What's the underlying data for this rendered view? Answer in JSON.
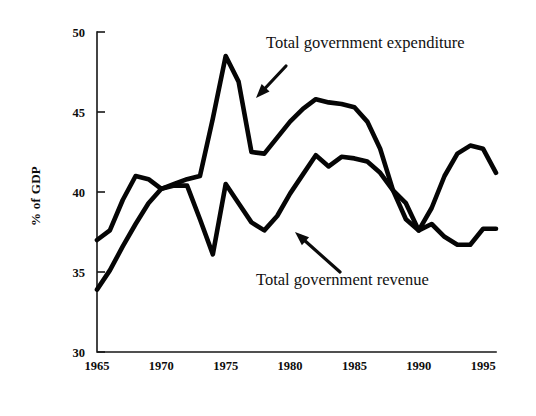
{
  "chart_data": {
    "type": "line",
    "title": "",
    "xlabel": "",
    "ylabel": "% of GDP",
    "xlim": [
      1965,
      1996
    ],
    "ylim": [
      30,
      50
    ],
    "grid": false,
    "legend_position": "inline-annotations",
    "x_ticks": [
      "1965",
      "1970",
      "1975",
      "1980",
      "1985",
      "1990",
      "1995"
    ],
    "x_tick_values": [
      1965,
      1970,
      1975,
      1980,
      1985,
      1990,
      1995
    ],
    "y_ticks": [
      "30",
      "35",
      "40",
      "45",
      "50"
    ],
    "y_tick_values": [
      30,
      35,
      40,
      45,
      50
    ],
    "x": [
      1965,
      1966,
      1967,
      1968,
      1969,
      1970,
      1971,
      1972,
      1973,
      1974,
      1975,
      1976,
      1977,
      1978,
      1979,
      1980,
      1981,
      1982,
      1983,
      1984,
      1985,
      1986,
      1987,
      1988,
      1989,
      1990,
      1991,
      1992,
      1993,
      1994,
      1995,
      1996
    ],
    "series": [
      {
        "name": "Total government expenditure",
        "values": [
          37.0,
          37.6,
          39.5,
          41.0,
          40.8,
          40.2,
          40.5,
          40.8,
          41.0,
          44.6,
          48.5,
          46.9,
          42.5,
          42.4,
          43.4,
          44.4,
          45.2,
          45.8,
          45.6,
          45.5,
          45.3,
          44.4,
          42.7,
          40.1,
          38.3,
          37.6,
          39.0,
          41.0,
          42.4,
          42.9,
          42.7,
          41.2
        ]
      },
      {
        "name": "Total government revenue",
        "values": [
          33.9,
          35.1,
          36.6,
          38.0,
          39.3,
          40.2,
          40.4,
          40.4,
          38.3,
          36.1,
          40.5,
          39.3,
          38.1,
          37.6,
          38.5,
          39.9,
          41.1,
          42.3,
          41.6,
          42.2,
          42.1,
          41.9,
          41.2,
          40.1,
          39.3,
          37.6,
          38.0,
          37.2,
          36.7,
          36.7,
          37.7,
          37.7
        ]
      }
    ],
    "annotations": [
      {
        "text": "Total government expenditure",
        "label_x": 266,
        "label_y": 48,
        "arrow_from_x": 286,
        "arrow_from_y": 66,
        "arrow_to_x": 256,
        "arrow_to_y": 98,
        "points_to_series": "Total government expenditure"
      },
      {
        "text": "Total government revenue",
        "label_x": 256,
        "label_y": 285,
        "arrow_from_x": 340,
        "arrow_from_y": 272,
        "arrow_to_x": 295,
        "arrow_to_y": 232,
        "points_to_series": "Total government revenue"
      }
    ],
    "colors": {
      "line": "#050505",
      "axis": "#171717",
      "text": "#0d0d0d",
      "background": "#ffffff"
    }
  },
  "plot_geometry": {
    "left": 97,
    "right": 496,
    "top": 32,
    "bottom": 352
  }
}
